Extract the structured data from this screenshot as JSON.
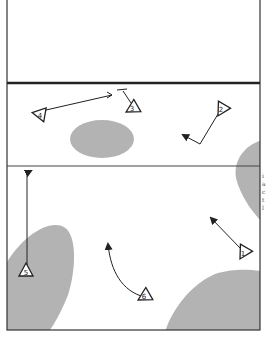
{
  "diagram": {
    "type": "court-play-diagram",
    "colors": {
      "background": "#ffffff",
      "lines": "#222222",
      "zones": "#b3b3b3",
      "marker_fill": "#ffffff"
    },
    "court": {
      "border": {
        "x": 7,
        "y": 0,
        "w": 253,
        "h": 330
      },
      "net_line": {
        "y": 83,
        "weight": "thick"
      },
      "attack_line": {
        "y": 166,
        "weight": "thin"
      }
    },
    "zones": [
      {
        "id": "zone-center-back",
        "shape": "ellipse"
      },
      {
        "id": "zone-right-edge",
        "shape": "blob"
      },
      {
        "id": "zone-left-bottom",
        "shape": "blob"
      },
      {
        "id": "zone-right-bottom",
        "shape": "blob"
      }
    ],
    "players": [
      {
        "number": "1",
        "x": 244,
        "y": 252
      },
      {
        "number": "2",
        "x": 222,
        "y": 109
      },
      {
        "number": "3",
        "x": 133,
        "y": 108
      },
      {
        "number": "4",
        "x": 40,
        "y": 114
      },
      {
        "number": "5",
        "x": 26,
        "y": 271
      },
      {
        "number": "6",
        "x": 145,
        "y": 296
      }
    ],
    "movements": [
      {
        "player": "1",
        "type": "arrow"
      },
      {
        "player": "2",
        "type": "arrow"
      },
      {
        "player": "3",
        "type": "block"
      },
      {
        "player": "4",
        "type": "block"
      },
      {
        "player": "5",
        "type": "arrow"
      },
      {
        "player": "6",
        "type": "arrow-curved"
      }
    ],
    "margin_text": [
      "i",
      "a",
      "c",
      "t",
      "l"
    ]
  }
}
